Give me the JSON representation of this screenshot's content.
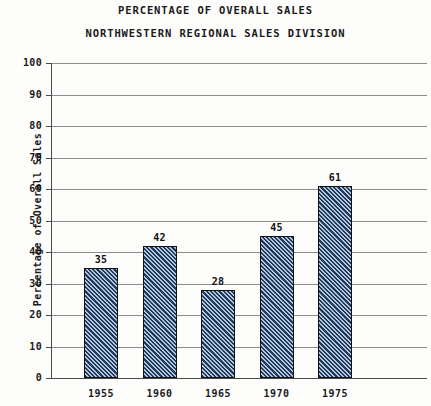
{
  "chart_data": {
    "type": "bar",
    "title": "PERCENTAGE OF OVERALL SALES",
    "subtitle": "NORTHWESTERN REGIONAL SALES DIVISION",
    "xlabel": "",
    "ylabel": "Percentage of Overall Sales",
    "categories": [
      "1955",
      "1960",
      "1965",
      "1970",
      "1975"
    ],
    "values": [
      35,
      42,
      28,
      45,
      61
    ],
    "value_labels": [
      "35",
      "42",
      "28",
      "45",
      "61"
    ],
    "ylim": [
      0,
      100
    ],
    "ytick_labels": [
      "100",
      "90",
      "80",
      "70",
      "60",
      "50",
      "40",
      "30",
      "20",
      "10",
      "0"
    ],
    "ytick_values": [
      100,
      90,
      80,
      70,
      60,
      50,
      40,
      30,
      20,
      10,
      0
    ],
    "grid": "horizontal",
    "legend": "none",
    "bar_fill_color": "#1e3a5f",
    "bar_hatch_color": "#becde1",
    "bar_edge_color": "#111111",
    "grid_color": "#8d8d8d",
    "axis_color": "#4a4a4a",
    "background_color": "#fdfdfc",
    "text_color": "#1a1a1a"
  }
}
